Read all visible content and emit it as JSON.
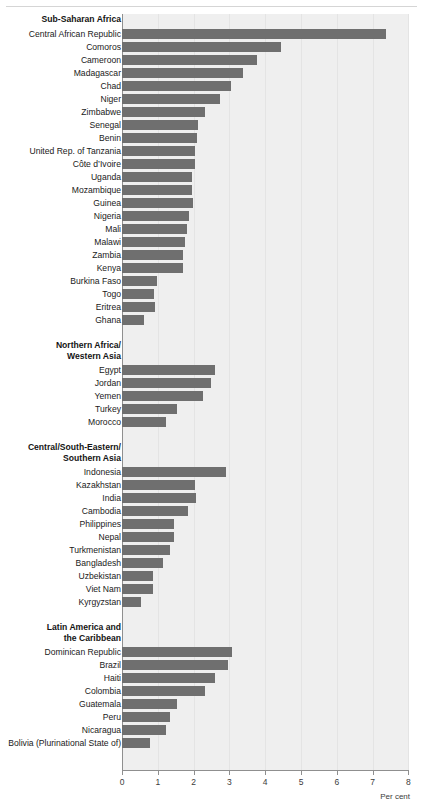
{
  "chart_data": {
    "type": "bar",
    "orientation": "horizontal",
    "title": "",
    "xlabel": "Per cent",
    "ylabel": "",
    "xlim": [
      0,
      8
    ],
    "xticks": [
      0,
      1,
      2,
      3,
      4,
      5,
      6,
      7,
      8
    ],
    "xtick_labels": [
      "0",
      "1",
      "2",
      "3",
      "4",
      "5",
      "6",
      "7",
      "8"
    ],
    "grid": true,
    "legend": "none",
    "bar_color": "#6f6f6f",
    "plot_background": "#efefef",
    "groups": [
      {
        "name": "Sub-Saharan Africa",
        "lines": [
          "Sub-Saharan Africa"
        ],
        "categories": [
          "Central African Republic",
          "Comoros",
          "Cameroon",
          "Madagascar",
          "Chad",
          "Niger",
          "Zimbabwe",
          "Senegal",
          "Benin",
          "United Rep. of Tanzania",
          "Côte d’Ivoire",
          "Uganda",
          "Mozambique",
          "Guinea",
          "Nigeria",
          "Mali",
          "Malawi",
          "Zambia",
          "Kenya",
          "Burkina Faso",
          "Togo",
          "Eritrea",
          "Ghana"
        ],
        "values": [
          7.37,
          4.44,
          3.77,
          3.38,
          3.04,
          2.73,
          2.32,
          2.12,
          2.1,
          2.03,
          2.03,
          1.96,
          1.96,
          1.97,
          1.87,
          1.82,
          1.76,
          1.7,
          1.7,
          0.99,
          0.89,
          0.91,
          0.61
        ]
      },
      {
        "name": "Northern Africa/Western Asia",
        "lines": [
          "Northern Africa/",
          "Western Asia"
        ],
        "categories": [
          "Egypt",
          "Jordan",
          "Yemen",
          "Turkey",
          "Morocco"
        ],
        "values": [
          2.6,
          2.48,
          2.26,
          1.54,
          1.22
        ]
      },
      {
        "name": "Central/South-Eastern/Southern Asia",
        "lines": [
          "Central/South-Eastern/",
          "Southern Asia"
        ],
        "categories": [
          "Indonesia",
          "Kazakhstan",
          "India",
          "Cambodia",
          "Philippines",
          "Nepal",
          "Turkmenistan",
          "Bangladesh",
          "Uzbekistan",
          "Viet Nam",
          "Kyrgyzstan"
        ],
        "values": [
          2.91,
          2.05,
          2.06,
          1.83,
          1.45,
          1.44,
          1.35,
          1.15,
          0.86,
          0.87,
          0.54
        ]
      },
      {
        "name": "Latin America and the Caribbean",
        "lines": [
          "Latin America and",
          "the Caribbean"
        ],
        "categories": [
          "Dominican Republic",
          "Brazil",
          "Haiti",
          "Colombia",
          "Guatemala",
          "Peru",
          "Nicaragua",
          "Bolivia (Plurinational State of)"
        ],
        "values": [
          3.07,
          2.97,
          2.59,
          2.33,
          1.55,
          1.33,
          1.23,
          0.77
        ]
      }
    ]
  }
}
